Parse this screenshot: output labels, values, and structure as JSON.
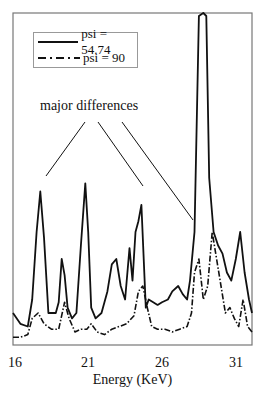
{
  "chart_data": {
    "type": "line",
    "title": "",
    "xlabel": "Energy (KeV)",
    "ylabel": "",
    "xlim": [
      16,
      32.2
    ],
    "ylim": [
      0,
      100
    ],
    "x_ticks": [
      16,
      21,
      26,
      31
    ],
    "grid": false,
    "legend_position": "upper-left",
    "annotations": [
      {
        "text": "major differences",
        "pointing_to_keV": [
          17.8,
          24.8,
          28.3
        ]
      }
    ],
    "series": [
      {
        "name": "psi = 54.74",
        "style": "solid",
        "x": [
          16,
          16.5,
          17,
          17.3,
          17.6,
          17.85,
          18.1,
          18.4,
          18.9,
          19.1,
          19.3,
          19.5,
          19.7,
          20,
          20.3,
          20.6,
          20.9,
          21.1,
          21.3,
          21.6,
          22,
          22.4,
          22.7,
          23,
          23.3,
          23.6,
          23.9,
          24.1,
          24.3,
          24.5,
          24.7,
          25,
          25.2,
          25.5,
          25.8,
          26.1,
          26.5,
          26.8,
          27.2,
          27.5,
          27.8,
          28,
          28.3,
          28.6,
          28.9,
          29.1,
          29.3,
          29.6,
          29.9,
          30.2,
          30.5,
          30.8,
          31.1,
          31.4,
          31.7,
          32,
          32.2
        ],
        "values": [
          10,
          6,
          5,
          15,
          40,
          55,
          38,
          10,
          10,
          14,
          30,
          24,
          12,
          8,
          10,
          35,
          58,
          40,
          12,
          8,
          10,
          18,
          28,
          30,
          20,
          15,
          34,
          22,
          40,
          44,
          50,
          12,
          15,
          14,
          13,
          14,
          15,
          18,
          20,
          17,
          15,
          22,
          40,
          120,
          140,
          120,
          60,
          40,
          35,
          32,
          25,
          22,
          30,
          40,
          25,
          15,
          10
        ]
      },
      {
        "name": "psi = 90",
        "style": "dash-dot",
        "x": [
          16,
          16.5,
          17,
          17.3,
          17.7,
          18.1,
          18.6,
          19.1,
          19.5,
          19.8,
          20.2,
          20.6,
          21,
          21.3,
          21.7,
          22.2,
          22.7,
          23.2,
          23.7,
          24.2,
          24.5,
          24.8,
          25.1,
          25.4,
          25.8,
          26.3,
          26.8,
          27.3,
          27.8,
          28.1,
          28.3,
          28.6,
          28.9,
          29.2,
          29.5,
          29.8,
          30.1,
          30.4,
          30.7,
          31,
          31.3,
          31.6,
          31.9,
          32.2
        ],
        "values": [
          1,
          1,
          2,
          8,
          10,
          6,
          4,
          4,
          14,
          8,
          3,
          4,
          4,
          6,
          3,
          2,
          4,
          5,
          6,
          9,
          18,
          20,
          12,
          5,
          4,
          4,
          3,
          4,
          5,
          10,
          25,
          30,
          15,
          20,
          40,
          30,
          20,
          10,
          12,
          8,
          5,
          15,
          5,
          3
        ]
      }
    ]
  },
  "legend": {
    "items": [
      {
        "label": "psi = 54.74"
      },
      {
        "label": "psi = 90"
      }
    ]
  },
  "annotation": {
    "label": "major differences"
  },
  "axis": {
    "xlabel": "Energy (KeV)",
    "ticks": [
      "16",
      "21",
      "26",
      "31"
    ]
  }
}
